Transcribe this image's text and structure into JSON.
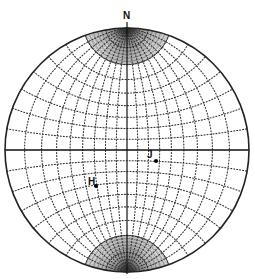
{
  "diagram": {
    "type": "equatorial stereonet (Wulff net)",
    "north_label": "N",
    "center": [
      127,
      150
    ],
    "radius": 122,
    "grid_interval_deg": 10,
    "fine_interval_deg": 2,
    "fine_polar_cap_deg": 20,
    "colors": {
      "primitive": "#222222",
      "grid": "#333333",
      "axis": "#111111",
      "background": "#ffffff"
    },
    "points": [
      {
        "label": "J",
        "dot": [
          156,
          161
        ],
        "label_pos": [
          147,
          150
        ]
      },
      {
        "label": "H",
        "dot": [
          96,
          186
        ],
        "label_pos": [
          88,
          177
        ]
      }
    ]
  }
}
